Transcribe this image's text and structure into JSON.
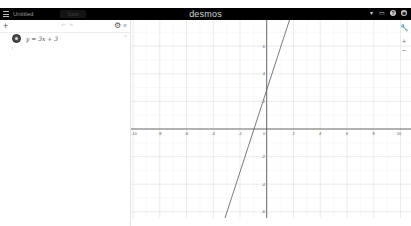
{
  "header": {
    "menu_icon": "hamburger-icon",
    "title": "Untitled",
    "save_label": "Save",
    "brand": "desmos",
    "icons": [
      {
        "name": "share-icon",
        "glyph": "▾"
      },
      {
        "name": "fullscreen-icon",
        "glyph": "▭"
      },
      {
        "name": "help-icon",
        "glyph": "?"
      },
      {
        "name": "language-icon",
        "glyph": "⊕"
      }
    ]
  },
  "toolbar": {
    "add_glyph": "+",
    "undo_glyph": "↶",
    "redo_glyph": "↷",
    "settings_glyph": "⚙",
    "collapse_glyph": "«"
  },
  "expressions": [
    {
      "latex": "y = 3x + 3",
      "color": "#4a4a4a",
      "delete_glyph": "×"
    }
  ],
  "graph_controls": {
    "settings_glyph": "🔧",
    "zoom_in_glyph": "+",
    "zoom_out_glyph": "−"
  },
  "graph": {
    "x_ticks": [
      "-10",
      "-8",
      "-6",
      "-4",
      "-2",
      "2",
      "4",
      "6",
      "8",
      "10"
    ],
    "y_ticks": [
      "6",
      "4",
      "2",
      "-2",
      "-4",
      "-6"
    ],
    "origin_label": "0",
    "line_color": "#6b6b6b",
    "axis_color": "#555555",
    "grid_color": "#e2e2e2"
  }
}
